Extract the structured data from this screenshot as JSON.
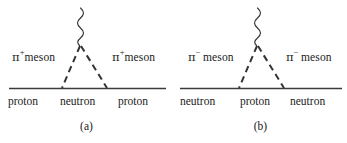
{
  "figure": {
    "background_color": "#ffffff",
    "stroke_color": "#333333",
    "text_color": "#1a1a1a",
    "width": 347,
    "height": 143
  },
  "diagrams": [
    {
      "id": "a",
      "caption": "(a)",
      "exchange_particle": {
        "symbol": "π",
        "charge": "+",
        "name": "meson",
        "label_left": "π+meson",
        "label_right": "π+meson",
        "spacing": "none",
        "line_style": "dashed"
      },
      "baryons": {
        "left": "proton",
        "middle": "neutron",
        "right": "proton"
      },
      "photon": {
        "style": "wavy",
        "name": "photon-wavy-line"
      }
    },
    {
      "id": "b",
      "caption": "(b)",
      "exchange_particle": {
        "symbol": "π",
        "charge": "−",
        "name": "meson",
        "label_left": "π− meson",
        "label_right": "π− meson",
        "spacing": "wide",
        "line_style": "dashed"
      },
      "baryons": {
        "left": "neutron",
        "middle": "proton",
        "right": "neutron"
      },
      "photon": {
        "style": "wavy",
        "name": "photon-wavy-line"
      }
    }
  ],
  "labels": {
    "a": {
      "pi": "π",
      "charge": "+",
      "meson": "meson",
      "baryon_left": "proton",
      "baryon_mid": "neutron",
      "baryon_right": "proton",
      "caption": "(a)"
    },
    "b": {
      "pi": "π",
      "charge": "−",
      "meson": "meson",
      "baryon_left": "neutron",
      "baryon_mid": "proton",
      "baryon_right": "neutron",
      "caption": "(b)"
    }
  }
}
